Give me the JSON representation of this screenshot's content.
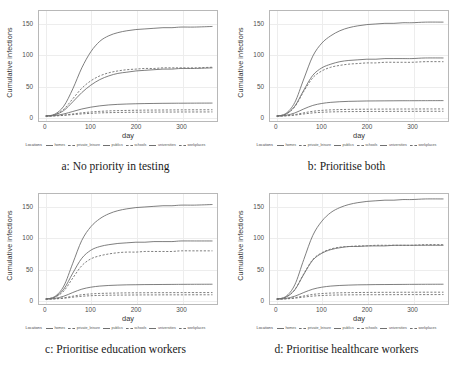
{
  "figure": {
    "layout": "2x2 panel grid",
    "background": "#ffffff",
    "legend_title": "Locations"
  },
  "axes": {
    "xlabel": "day",
    "ylabel": "Cumulative infections",
    "xticks": [
      "0",
      "100",
      "200",
      "300"
    ],
    "yticks": [
      "0",
      "50",
      "100",
      "150"
    ],
    "xlim": [
      -15,
      380
    ],
    "ylim": [
      -8,
      170
    ]
  },
  "series_names": [
    "homes",
    "private_leisure",
    "publics",
    "schools",
    "universities",
    "workplaces"
  ],
  "series_styles": [
    "solid",
    "dashed",
    "solid",
    "dashed",
    "solid",
    "dashed"
  ],
  "series_color": "#6f6f6f",
  "panels": [
    {
      "id": "a",
      "caption": "a: No priority in testing"
    },
    {
      "id": "b",
      "caption": "b: Prioritise both"
    },
    {
      "id": "c",
      "caption": "c: Prioritise education workers"
    },
    {
      "id": "d",
      "caption": "d: Prioritise healthcare workers"
    }
  ],
  "chart_data": [
    {
      "type": "line",
      "title": "a: No priority in testing",
      "xlabel": "day",
      "ylabel": "Cumulative infections",
      "xlim": [
        0,
        370
      ],
      "ylim": [
        0,
        170
      ],
      "grid": true,
      "legend_position": "bottom",
      "x": [
        0,
        20,
        40,
        60,
        80,
        100,
        120,
        140,
        160,
        180,
        200,
        220,
        240,
        260,
        280,
        300,
        330,
        370
      ],
      "series": [
        {
          "name": "homes",
          "style": "solid",
          "values": [
            0,
            3,
            16,
            44,
            78,
            104,
            121,
            130,
            135,
            138,
            140,
            141,
            142,
            143,
            143,
            144,
            144,
            145
          ]
        },
        {
          "name": "private_leisure",
          "style": "dashed",
          "values": [
            0,
            2,
            11,
            28,
            45,
            57,
            65,
            70,
            73,
            75,
            76,
            77,
            77,
            78,
            78,
            78,
            78,
            79
          ]
        },
        {
          "name": "publics",
          "style": "solid",
          "values": [
            0,
            2,
            9,
            23,
            38,
            50,
            59,
            65,
            69,
            71,
            73,
            74,
            75,
            76,
            76,
            77,
            77,
            78
          ]
        },
        {
          "name": "schools",
          "style": "dashed",
          "values": [
            0,
            0.4,
            1.6,
            3.4,
            5.2,
            6.6,
            7.6,
            8.3,
            8.8,
            9.1,
            9.4,
            9.6,
            9.7,
            9.8,
            9.9,
            10,
            10.1,
            10.2
          ]
        },
        {
          "name": "universities",
          "style": "solid",
          "values": [
            0,
            0.8,
            3.4,
            7.4,
            11.4,
            14.4,
            16.5,
            18,
            18.9,
            19.5,
            19.9,
            20.2,
            20.4,
            20.6,
            20.7,
            20.8,
            20.9,
            21
          ]
        },
        {
          "name": "workplaces",
          "style": "dashed",
          "values": [
            0,
            0.3,
            1.1,
            2.3,
            3.5,
            4.4,
            5.1,
            5.5,
            5.8,
            6,
            6.2,
            6.3,
            6.4,
            6.5,
            6.5,
            6.6,
            6.6,
            6.7
          ]
        }
      ]
    },
    {
      "type": "line",
      "title": "b: Prioritise both",
      "xlabel": "day",
      "ylabel": "Cumulative infections",
      "xlim": [
        0,
        370
      ],
      "ylim": [
        0,
        170
      ],
      "grid": true,
      "legend_position": "bottom",
      "x": [
        0,
        20,
        40,
        60,
        80,
        100,
        120,
        140,
        160,
        180,
        200,
        220,
        240,
        260,
        280,
        300,
        330,
        370
      ],
      "series": [
        {
          "name": "homes",
          "style": "solid",
          "values": [
            0,
            4,
            22,
            60,
            97,
            118,
            130,
            138,
            143,
            146,
            148,
            149,
            150,
            150,
            151,
            151,
            152,
            152
          ]
        },
        {
          "name": "private_leisure",
          "style": "dashed",
          "values": [
            0,
            3,
            15,
            40,
            62,
            73,
            79,
            82,
            84,
            85,
            86,
            86,
            87,
            87,
            87,
            87,
            88,
            88
          ]
        },
        {
          "name": "publics",
          "style": "solid",
          "values": [
            0,
            3,
            16,
            42,
            66,
            78,
            84,
            88,
            90,
            91,
            92,
            92,
            93,
            93,
            93,
            93,
            94,
            94
          ]
        },
        {
          "name": "schools",
          "style": "dashed",
          "values": [
            0,
            0.5,
            2.3,
            5.2,
            7.7,
            9.2,
            10,
            10.5,
            10.8,
            11,
            11.1,
            11.2,
            11.3,
            11.3,
            11.4,
            11.4,
            11.5,
            11.5
          ]
        },
        {
          "name": "universities",
          "style": "solid",
          "values": [
            0,
            1.1,
            5,
            11.5,
            17.2,
            20.4,
            22.2,
            23.2,
            23.8,
            24.1,
            24.4,
            24.5,
            24.6,
            24.7,
            24.8,
            24.8,
            24.9,
            25
          ]
        },
        {
          "name": "workplaces",
          "style": "dashed",
          "values": [
            0,
            0.3,
            1.5,
            3.4,
            5.1,
            6.1,
            6.7,
            7,
            7.2,
            7.3,
            7.4,
            7.5,
            7.5,
            7.6,
            7.6,
            7.6,
            7.7,
            7.7
          ]
        }
      ]
    },
    {
      "type": "line",
      "title": "c: Prioritise education workers",
      "xlabel": "day",
      "ylabel": "Cumulative infections",
      "xlim": [
        0,
        370
      ],
      "ylim": [
        0,
        170
      ],
      "grid": true,
      "legend_position": "bottom",
      "x": [
        0,
        20,
        40,
        60,
        80,
        100,
        120,
        140,
        160,
        180,
        200,
        220,
        240,
        260,
        280,
        300,
        330,
        370
      ],
      "series": [
        {
          "name": "homes",
          "style": "solid",
          "values": [
            0,
            4,
            21,
            58,
            95,
            117,
            130,
            138,
            143,
            146,
            148,
            149,
            150,
            151,
            151,
            152,
            152,
            153
          ]
        },
        {
          "name": "private_leisure",
          "style": "dashed",
          "values": [
            0,
            3,
            13,
            34,
            54,
            65,
            70,
            73,
            75,
            76,
            76,
            77,
            77,
            77,
            77,
            78,
            78,
            78
          ]
        },
        {
          "name": "publics",
          "style": "solid",
          "values": [
            0,
            3,
            16,
            42,
            66,
            79,
            85,
            88,
            90,
            91,
            92,
            92,
            93,
            93,
            93,
            94,
            94,
            94
          ]
        },
        {
          "name": "schools",
          "style": "dashed",
          "values": [
            0,
            0.4,
            2,
            4.6,
            7,
            8.3,
            9.1,
            9.5,
            9.8,
            10,
            10.1,
            10.2,
            10.3,
            10.3,
            10.4,
            10.4,
            10.5,
            10.5
          ]
        },
        {
          "name": "universities",
          "style": "solid",
          "values": [
            0,
            1,
            4.6,
            10.6,
            16,
            19.2,
            21,
            22,
            22.6,
            23,
            23.2,
            23.4,
            23.5,
            23.6,
            23.7,
            23.8,
            23.9,
            24
          ]
        },
        {
          "name": "workplaces",
          "style": "dashed",
          "values": [
            0,
            0.3,
            1.3,
            3,
            4.5,
            5.4,
            5.9,
            6.2,
            6.4,
            6.5,
            6.6,
            6.7,
            6.7,
            6.8,
            6.8,
            6.8,
            6.9,
            6.9
          ]
        }
      ]
    },
    {
      "type": "line",
      "title": "d: Prioritise healthcare workers",
      "xlabel": "day",
      "ylabel": "Cumulative infections",
      "xlim": [
        0,
        370
      ],
      "ylim": [
        0,
        170
      ],
      "grid": true,
      "legend_position": "bottom",
      "x": [
        0,
        20,
        40,
        60,
        80,
        100,
        120,
        140,
        160,
        180,
        200,
        220,
        240,
        260,
        280,
        300,
        330,
        370
      ],
      "series": [
        {
          "name": "homes",
          "style": "solid",
          "values": [
            0,
            4,
            23,
            64,
            103,
            126,
            140,
            148,
            153,
            156,
            158,
            159,
            160,
            160,
            161,
            161,
            162,
            162
          ]
        },
        {
          "name": "private_leisure",
          "style": "dashed",
          "values": [
            0,
            3,
            15,
            41,
            64,
            75,
            81,
            84,
            85,
            86,
            86,
            87,
            87,
            87,
            87,
            87,
            88,
            88
          ]
        },
        {
          "name": "publics",
          "style": "solid",
          "values": [
            0,
            3,
            15,
            40,
            63,
            74,
            80,
            83,
            85,
            85,
            86,
            86,
            86,
            87,
            87,
            87,
            87,
            87
          ]
        },
        {
          "name": "schools",
          "style": "dashed",
          "values": [
            0,
            0.5,
            2.2,
            5,
            7.5,
            8.9,
            9.7,
            10.1,
            10.4,
            10.6,
            10.7,
            10.8,
            10.9,
            10.9,
            11,
            11,
            11.1,
            11.1
          ]
        },
        {
          "name": "universities",
          "style": "solid",
          "values": [
            0,
            1,
            4.6,
            10.6,
            16,
            19.2,
            21,
            22,
            22.6,
            23,
            23.2,
            23.4,
            23.5,
            23.6,
            23.7,
            23.8,
            23.9,
            24
          ]
        },
        {
          "name": "workplaces",
          "style": "dashed",
          "values": [
            0,
            0.3,
            1.4,
            3.2,
            4.8,
            5.7,
            6.3,
            6.6,
            6.8,
            6.9,
            7,
            7,
            7.1,
            7.1,
            7.2,
            7.2,
            7.2,
            7.3
          ]
        }
      ]
    }
  ]
}
